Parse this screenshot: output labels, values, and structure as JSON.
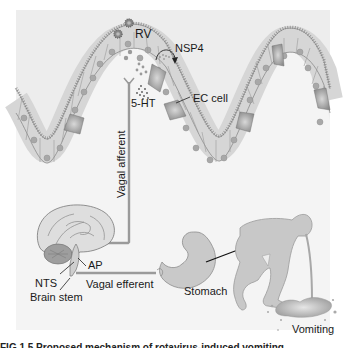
{
  "figure": {
    "labels": {
      "virus": "RV",
      "toxin": "NSP4",
      "serotonin": "5-HT",
      "ec_cell": "EC cell",
      "vagal_afferent": "Vagal afferent",
      "area_postrema": "AP",
      "nts": "NTS",
      "vagal_efferent": "Vagal efferent",
      "brain_stem": "Brain stem",
      "stomach": "Stomach",
      "vomiting": "Vomiting"
    },
    "caption_fragment": "FIG 1.5   Proposed mechanism of rotavirus-induced vomiting"
  },
  "colors": {
    "panel_bg": "#ededed",
    "villus_fill": "#f3f3f3",
    "cell_fill": "#e2e2e2",
    "cell_stroke": "#8a8a8a",
    "nucleus": "#a8a8a8",
    "ec_cell_dark": "#9a9a9a",
    "nerve": "#9a9a9a",
    "organ_fill": "#c8c8c8",
    "organ_stroke": "#8d8d8d",
    "text": "#1a1a1a"
  }
}
